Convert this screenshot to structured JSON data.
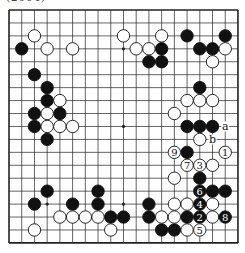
{
  "caption": "(2004)",
  "board": {
    "size": 19,
    "origin_x": 9,
    "origin_y": 10,
    "spacing_x": 12.72,
    "spacing_y": 12.94,
    "line_color": "#222222",
    "stone_black": "#111111",
    "stone_white": "#ffffff",
    "stone_radius": 6.2,
    "hoshi": [
      [
        3,
        3
      ],
      [
        9,
        3
      ],
      [
        15,
        3
      ],
      [
        3,
        9
      ],
      [
        9,
        9
      ],
      [
        15,
        9
      ],
      [
        3,
        15
      ],
      [
        9,
        15
      ],
      [
        15,
        15
      ]
    ],
    "black_stones": [
      [
        1,
        3
      ],
      [
        2,
        5
      ],
      [
        3,
        6
      ],
      [
        3,
        7
      ],
      [
        2,
        8
      ],
      [
        4,
        8
      ],
      [
        2,
        9
      ],
      [
        3,
        10
      ],
      [
        3,
        14
      ],
      [
        2,
        15
      ],
      [
        5,
        15
      ],
      [
        7,
        14
      ],
      [
        7,
        15
      ],
      [
        8,
        16
      ],
      [
        9,
        16
      ],
      [
        11,
        15
      ],
      [
        11,
        16
      ],
      [
        12,
        17
      ],
      [
        13,
        17
      ],
      [
        14,
        16
      ],
      [
        14,
        2
      ],
      [
        17,
        2
      ],
      [
        12,
        3
      ],
      [
        15,
        3
      ],
      [
        16,
        3
      ],
      [
        11,
        4
      ],
      [
        12,
        4
      ],
      [
        15,
        6
      ],
      [
        14,
        9
      ],
      [
        15,
        9
      ],
      [
        16,
        9
      ],
      [
        14,
        11
      ],
      [
        15,
        13
      ],
      [
        16,
        14
      ],
      [
        17,
        14
      ]
    ],
    "white_stones": [
      [
        2,
        2
      ],
      [
        3,
        3
      ],
      [
        5,
        3
      ],
      [
        4,
        7
      ],
      [
        3,
        8
      ],
      [
        3,
        9
      ],
      [
        4,
        9
      ],
      [
        5,
        9
      ],
      [
        4,
        16
      ],
      [
        5,
        16
      ],
      [
        6,
        16
      ],
      [
        7,
        16
      ],
      [
        2,
        17
      ],
      [
        8,
        17
      ],
      [
        9,
        2
      ],
      [
        12,
        2
      ],
      [
        10,
        3
      ],
      [
        11,
        3
      ],
      [
        17,
        3
      ],
      [
        16,
        4
      ],
      [
        14,
        7
      ],
      [
        15,
        7
      ],
      [
        16,
        7
      ],
      [
        13,
        8
      ],
      [
        15,
        10
      ],
      [
        16,
        12
      ],
      [
        13,
        13
      ],
      [
        13,
        15
      ],
      [
        14,
        15
      ],
      [
        16,
        15
      ],
      [
        12,
        16
      ],
      [
        13,
        16
      ],
      [
        16,
        16
      ],
      [
        14,
        17
      ]
    ],
    "numbered_moves": [
      {
        "n": "1",
        "color": "white",
        "pos": [
          17,
          11
        ]
      },
      {
        "n": "2",
        "color": "black",
        "pos": [
          15,
          16
        ]
      },
      {
        "n": "3",
        "color": "white",
        "pos": [
          15,
          12
        ]
      },
      {
        "n": "4",
        "color": "black",
        "pos": [
          15,
          15
        ]
      },
      {
        "n": "5",
        "color": "white",
        "pos": [
          15,
          17
        ]
      },
      {
        "n": "6",
        "color": "black",
        "pos": [
          15,
          14
        ]
      },
      {
        "n": "7",
        "color": "white",
        "pos": [
          14,
          12
        ]
      },
      {
        "n": "8",
        "color": "black",
        "pos": [
          17,
          16
        ]
      },
      {
        "n": "9",
        "color": "white",
        "pos": [
          13,
          11
        ]
      }
    ],
    "letter_labels": [
      {
        "t": "a",
        "pos": [
          17,
          9
        ]
      },
      {
        "t": "b",
        "pos": [
          16,
          10
        ]
      }
    ]
  }
}
